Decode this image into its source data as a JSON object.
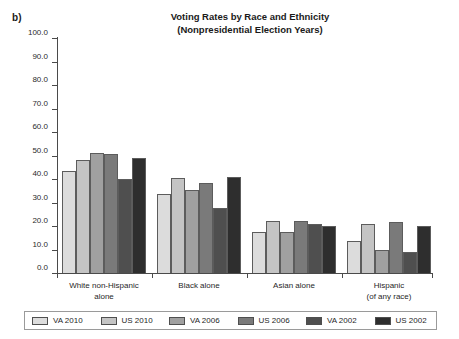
{
  "panel_label": "b)",
  "chart_data": {
    "type": "bar",
    "title": "Voting Rates by Race and Ethnicity",
    "subtitle": "(Nonpresidential Election Years)",
    "xlabel": "",
    "ylabel": "",
    "ylim": [
      0,
      100
    ],
    "yticks": [
      "0.0",
      "10.0",
      "20.0",
      "30.0",
      "40.0",
      "50.0",
      "60.0",
      "70.0",
      "80.0",
      "90.0",
      "100.0"
    ],
    "grid": false,
    "legend_position": "bottom",
    "categories": [
      [
        "White non-Hispanic",
        "alone"
      ],
      [
        "Black alone"
      ],
      [
        "Asian alone"
      ],
      [
        "Hispanic",
        "(of any race)"
      ]
    ],
    "category_labels": [
      "White non-Hispanic alone",
      "Black alone",
      "Asian alone",
      "Hispanic (of any race)"
    ],
    "series": [
      {
        "name": "VA 2010",
        "color": "#dcdcdc",
        "values": [
          43.5,
          33.5,
          17.5,
          13.5
        ]
      },
      {
        "name": "US 2010",
        "color": "#c4c4c4",
        "values": [
          48.0,
          40.5,
          22.0,
          21.0
        ]
      },
      {
        "name": "VA 2006",
        "color": "#a0a0a0",
        "values": [
          51.0,
          35.5,
          17.5,
          10.0
        ]
      },
      {
        "name": "US 2006",
        "color": "#7a7a7a",
        "values": [
          50.5,
          38.5,
          22.0,
          21.5
        ]
      },
      {
        "name": "VA 2002",
        "color": "#4f4f4f",
        "values": [
          40.0,
          27.5,
          21.0,
          9.0
        ]
      },
      {
        "name": "US 2002",
        "color": "#2e2e2e",
        "values": [
          49.0,
          41.0,
          20.0,
          20.0
        ]
      }
    ]
  }
}
